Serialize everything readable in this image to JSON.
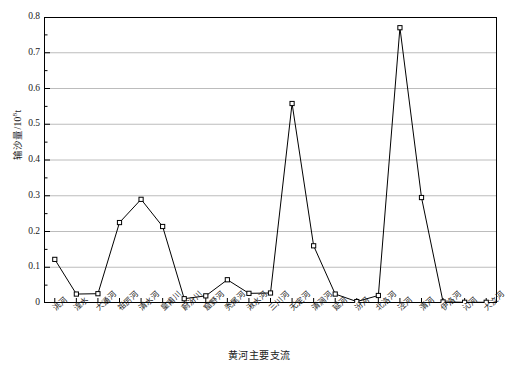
{
  "chart_data": {
    "type": "line",
    "title": "",
    "subtitle": "",
    "xlabel": "黄河主要支流",
    "ylabel": "输沙量/10⁸t",
    "ylabel_main": "输沙量/10",
    "ylabel_exponent": "8",
    "ylabel_unit": "t",
    "ylim": [
      0,
      0.8
    ],
    "ytick_values": [
      0,
      0.1,
      0.2,
      0.3,
      0.4,
      0.5,
      0.6,
      0.7,
      0.8
    ],
    "ytick_labels": [
      "0",
      "0.1",
      "0.2",
      "0.3",
      "0.4",
      "0.5",
      "0.6",
      "0.7",
      "0.8"
    ],
    "minor_tick_step": 0.05,
    "grid": "horizontal-major",
    "legend": "none",
    "marker": "open-square",
    "line_color": "#000000",
    "grid_color": "#b4b4b4",
    "axis_color": "#000000",
    "categories": [
      "洮河",
      "湟水",
      "大通河",
      "祖厉河",
      "清水河",
      "皇甫川",
      "蔚汾川",
      "窟野河",
      "秃尾河",
      "湫水河",
      "三川河",
      "无定河",
      "清涧河",
      "延河",
      "汾河",
      "北洛河",
      "泾河",
      "渭河",
      "伊洛河",
      "沁河",
      "大汶河"
    ],
    "values": [
      0.122,
      0.025,
      0.026,
      0.225,
      0.29,
      0.214,
      0.012,
      0.02,
      0.065,
      0.027,
      0.028,
      0.558,
      0.16,
      0.025,
      0.004,
      0.021,
      0.77,
      0.295,
      0.003,
      0.002,
      0.002
    ]
  }
}
